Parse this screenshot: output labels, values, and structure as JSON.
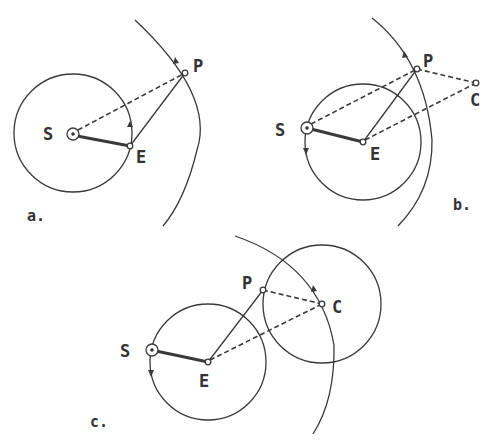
{
  "panels": [
    {
      "label": "a.",
      "points": {
        "S": "S",
        "E": "E",
        "P": "P"
      }
    },
    {
      "label": "b.",
      "points": {
        "S": "S",
        "E": "E",
        "P": "P",
        "C": "C"
      }
    },
    {
      "label": "c.",
      "points": {
        "S": "S",
        "E": "E",
        "P": "P",
        "C": "C"
      }
    }
  ],
  "colors": {
    "ink": "#3a3a3a",
    "background": "#ffffff"
  }
}
